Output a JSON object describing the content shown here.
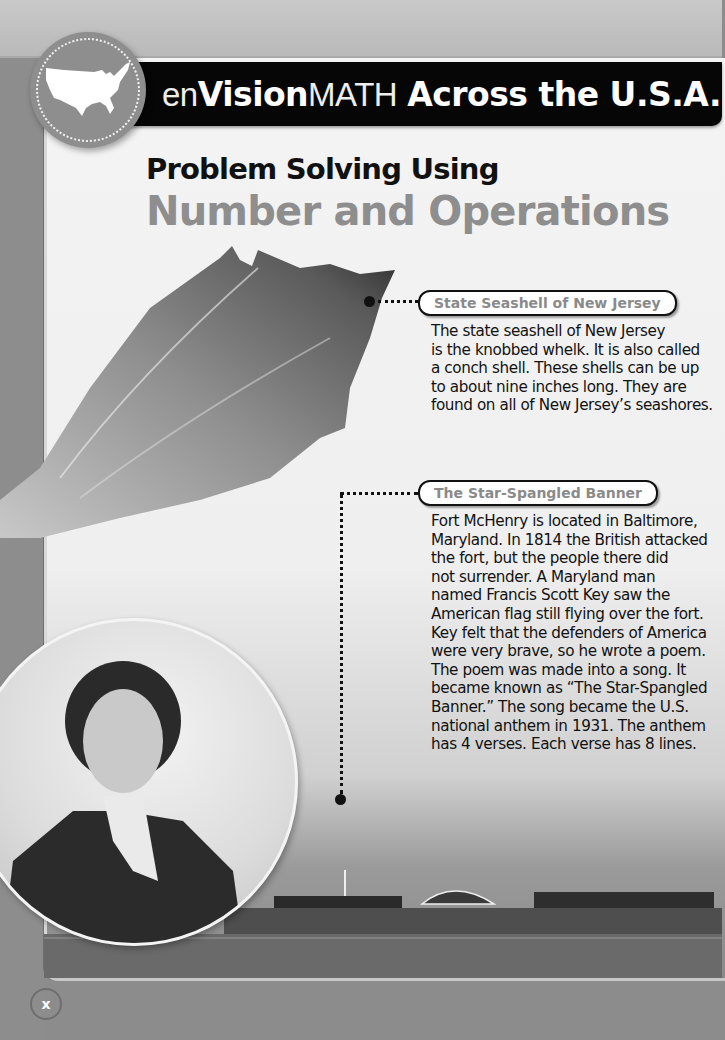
{
  "header": {
    "brand_en": "en",
    "brand_vision": "Vision",
    "brand_math": "MATH",
    "title_rest": "Across the U.S.A.",
    "badge_icon": "usa-map-icon"
  },
  "titles": {
    "line1": "Problem Solving Using",
    "line2": "Number and Operations"
  },
  "callouts": [
    {
      "label": "State Seashell of New Jersey",
      "lines": [
        "The state seashell of New Jersey",
        "is the knobbed whelk. It is also called",
        "a conch shell. These shells can be up",
        "to about nine inches long. They are",
        "found on all of New Jersey’s seashores."
      ]
    },
    {
      "label": "The Star-Spangled Banner",
      "lines": [
        "Fort McHenry is located in Baltimore,",
        "Maryland. In 1814 the British attacked",
        "the fort, but the people there did",
        "not surrender. A Maryland man",
        "named Francis Scott Key saw the",
        "American flag still flying over the fort.",
        "Key felt that the defenders of America",
        "were very brave, so he wrote a poem.",
        "The poem was made into a song. It",
        "became known as “The Star-Spangled",
        "Banner.” The song became the U.S.",
        "national anthem in 1931. The anthem",
        "has 4 verses. Each verse has 8 lines."
      ]
    }
  ],
  "images": {
    "shell": "knobbed-whelk-shell-photo",
    "portrait": "francis-scott-key-portrait",
    "fort": "fort-mchenry-photo"
  },
  "footer": {
    "page_number": "x"
  },
  "colors": {
    "header_bg": "#060606",
    "title_gray": "#8e8e8e",
    "label_gray": "#8a8a8a",
    "page_bg": "#8c8c8c"
  }
}
